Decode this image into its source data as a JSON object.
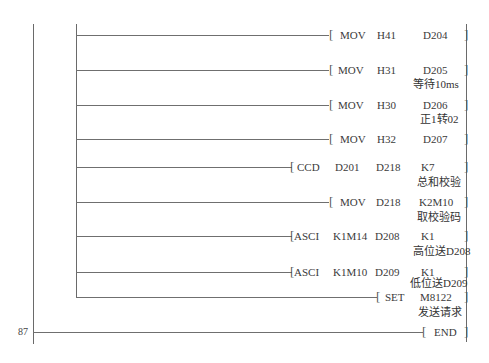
{
  "diagram": {
    "type": "PLC ladder diagram",
    "step_number": "87",
    "rungs": [
      {
        "instr": "MOV",
        "ops": [
          "H41",
          "D204"
        ],
        "comment": ""
      },
      {
        "instr": "MOV",
        "ops": [
          "H31",
          "D205"
        ],
        "comment": "等待10ms"
      },
      {
        "instr": "MOV",
        "ops": [
          "H30",
          "D206"
        ],
        "comment": "正1转02"
      },
      {
        "instr": "MOV",
        "ops": [
          "H32",
          "D207"
        ],
        "comment": ""
      },
      {
        "instr": "CCD",
        "ops": [
          "D201",
          "D218",
          "K7"
        ],
        "comment": "总和校验"
      },
      {
        "instr": "MOV",
        "ops": [
          "D218",
          "K2M10"
        ],
        "comment": "取校验码"
      },
      {
        "instr": "ASCI",
        "ops": [
          "K1M14",
          "D208",
          "K1"
        ],
        "comment": "高位送D208"
      },
      {
        "instr": "ASCI",
        "ops": [
          "K1M10",
          "D209",
          "K1"
        ],
        "comment": "低位送D209"
      },
      {
        "instr": "SET",
        "ops": [
          "M8122"
        ],
        "comment": "发送请求"
      },
      {
        "instr": "END",
        "ops": [],
        "comment": ""
      }
    ],
    "open_bracket": "[",
    "close_bracket": "]"
  }
}
